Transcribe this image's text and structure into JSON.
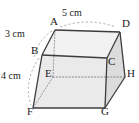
{
  "figure": {
    "shape": "cuboid",
    "projection": "oblique",
    "background_color": "#ffffff",
    "edge_color": "#3c3c3c",
    "hidden_edge_color": "#8c8c8c",
    "leader_color": "#9a9a9a",
    "face_colors": {
      "top": "#f2f2f2",
      "front": "#eaeaea",
      "right": "#dcdcdc"
    },
    "vertices": [
      {
        "id": "A",
        "label": "A",
        "x": 55,
        "y": 30,
        "hidden": false
      },
      {
        "id": "B",
        "label": "B",
        "x": 42,
        "y": 55,
        "hidden": false
      },
      {
        "id": "C",
        "label": "C",
        "x": 107,
        "y": 58,
        "hidden": false
      },
      {
        "id": "D",
        "label": "D",
        "x": 120,
        "y": 32,
        "hidden": false
      },
      {
        "id": "E",
        "label": "E",
        "x": 53,
        "y": 77,
        "hidden": true
      },
      {
        "id": "F",
        "label": "F",
        "x": 33,
        "y": 108,
        "hidden": false
      },
      {
        "id": "G",
        "label": "G",
        "x": 105,
        "y": 108,
        "hidden": false
      },
      {
        "id": "H",
        "label": "H",
        "x": 125,
        "y": 77,
        "hidden": false
      }
    ],
    "dimensions": [
      {
        "id": "top-edge",
        "text": "5 cm",
        "measures": "A to D",
        "x": 72,
        "y": 14
      },
      {
        "id": "slant-edge",
        "text": "3 cm",
        "measures": "A to B",
        "x": 9,
        "y": 33
      },
      {
        "id": "vertical-edge",
        "text": "4 cm",
        "measures": "B to F",
        "x": 3,
        "y": 75
      }
    ]
  }
}
